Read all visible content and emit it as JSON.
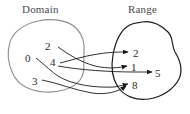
{
  "figure": {
    "type": "mapping-diagram",
    "background_color": "#ffffff",
    "domain": {
      "label": "Domain",
      "outline_color": "#8d8d8d",
      "elements": [
        "2",
        "0",
        "4",
        "3"
      ]
    },
    "range": {
      "label": "Range",
      "outline_color": "#1a1a1a",
      "elements": [
        "2",
        "1",
        "5",
        "8"
      ]
    },
    "mappings": [
      {
        "from": "2",
        "to": "1"
      },
      {
        "from": "0",
        "to": "8"
      },
      {
        "from": "4",
        "to": "2"
      },
      {
        "from": "4",
        "to": "5"
      },
      {
        "from": "3",
        "to": "8"
      }
    ],
    "arrow_color": "#1a1a1a"
  }
}
